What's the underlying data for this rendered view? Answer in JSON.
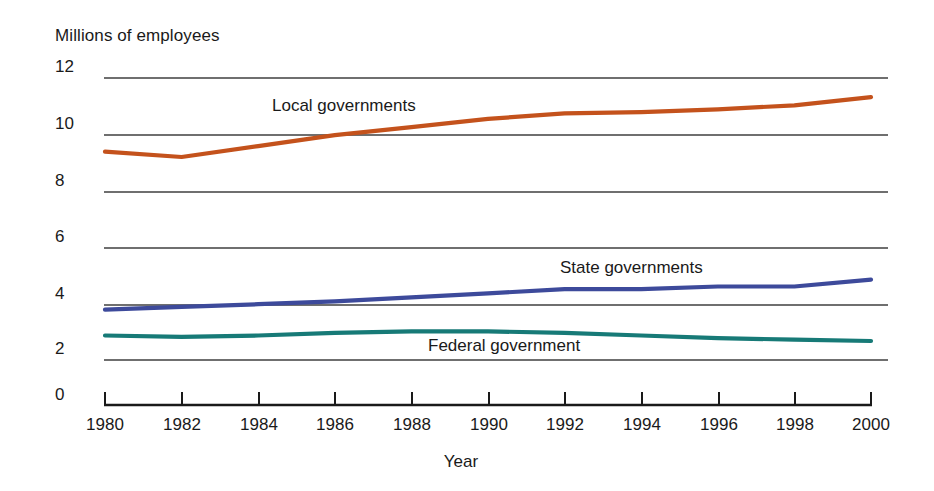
{
  "chart_data": {
    "type": "line",
    "title": "",
    "ylabel": "Millions of employees",
    "xlabel": "Year",
    "ylim": [
      0,
      12
    ],
    "xlim": [
      1980,
      2000
    ],
    "yticks": [
      "0",
      "2",
      "4",
      "6",
      "8",
      "10",
      "12"
    ],
    "ytick_values": [
      0,
      2,
      4,
      6,
      8,
      10,
      12
    ],
    "xticks": [
      "1980",
      "1982",
      "1984",
      "1986",
      "1988",
      "1990",
      "1992",
      "1994",
      "1996",
      "1998",
      "2000"
    ],
    "xtick_values": [
      1980,
      1982,
      1984,
      1986,
      1988,
      1990,
      1992,
      1994,
      1996,
      1998,
      2000
    ],
    "grid": "horizontal",
    "legend_position": "inline-labels",
    "x": [
      1980,
      1982,
      1984,
      1986,
      1988,
      1990,
      1992,
      1994,
      1996,
      1998,
      2000
    ],
    "series": [
      {
        "name": "Local governments",
        "color": "#c4521c",
        "values": [
          9.3,
          9.1,
          9.5,
          9.9,
          10.2,
          10.5,
          10.7,
          10.75,
          10.85,
          11.0,
          11.3
        ]
      },
      {
        "name": "State governments",
        "color": "#3d4a9b",
        "values": [
          3.5,
          3.6,
          3.7,
          3.8,
          3.95,
          4.1,
          4.25,
          4.25,
          4.35,
          4.35,
          4.6
        ]
      },
      {
        "name": "Federal government",
        "color": "#177a77",
        "values": [
          2.55,
          2.5,
          2.55,
          2.65,
          2.7,
          2.7,
          2.65,
          2.55,
          2.45,
          2.4,
          2.35
        ]
      }
    ]
  },
  "labels": {
    "y_axis_title": "Millions of employees",
    "x_axis_title": "Year",
    "series_local": "Local governments",
    "series_state": "State governments",
    "series_federal": "Federal government"
  },
  "yticks": {
    "t0": "0",
    "t2": "2",
    "t4": "4",
    "t6": "6",
    "t8": "8",
    "t10": "10",
    "t12": "12"
  },
  "xticks": {
    "x1980": "1980",
    "x1982": "1982",
    "x1984": "1984",
    "x1986": "1986",
    "x1988": "1988",
    "x1990": "1990",
    "x1992": "1992",
    "x1994": "1994",
    "x1996": "1996",
    "x1998": "1998",
    "x2000": "2000"
  },
  "colors": {
    "local": "#c4521c",
    "state": "#3d4a9b",
    "federal": "#177a77",
    "grid": "#4a4a4a",
    "axis": "#1a1a1a",
    "background": "#ffffff"
  }
}
